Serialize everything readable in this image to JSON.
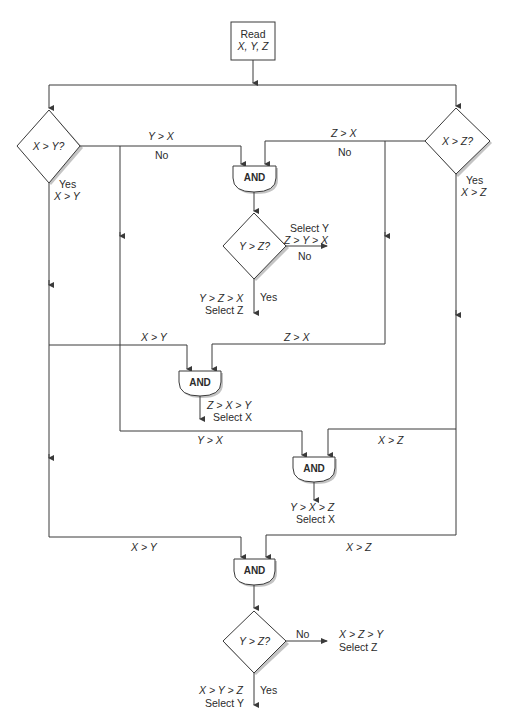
{
  "diagram": {
    "type": "flowchart",
    "start": {
      "line1": "Read",
      "line2": "X, Y, Z"
    },
    "decisions": {
      "left": "X > Y?",
      "right": "X > Z?",
      "middle_top": "Y > Z?",
      "bottom": "Y > Z?"
    },
    "and_gates": [
      "AND",
      "AND",
      "AND",
      "AND"
    ],
    "edge_labels": {
      "left_no_cond": "Y > X",
      "left_no": "No",
      "left_yes": "Yes",
      "left_yes_cond": "X > Y",
      "right_no_cond": "Z > X",
      "right_no": "No",
      "right_yes": "Yes",
      "right_yes_cond": "X > Z",
      "and2_left": "X > Y",
      "and2_right": "Z > X",
      "and3_left": "Y > X",
      "and3_right": "X > Z",
      "and4_left": "X > Y",
      "and4_right": "X > Z"
    },
    "outcomes": {
      "mid_no_select": "Select Y",
      "mid_no_cond": "Z > Y > X",
      "mid_no": "No",
      "mid_yes_cond": "Y > Z > X",
      "mid_yes_select": "Select Z",
      "mid_yes": "Yes",
      "and2_cond": "Z > X > Y",
      "and2_select": "Select X",
      "and3_cond": "Y > X > Z",
      "and3_select": "Select X",
      "bottom_no": "No",
      "bottom_no_cond": "X > Z > Y",
      "bottom_no_select": "Select Z",
      "bottom_yes_cond": "X > Y > Z",
      "bottom_yes_select": "Select Y",
      "bottom_yes": "Yes"
    }
  },
  "colors": {
    "line": "#3a3a3a",
    "shadow": "#b8b8b8",
    "background": "#ffffff"
  }
}
